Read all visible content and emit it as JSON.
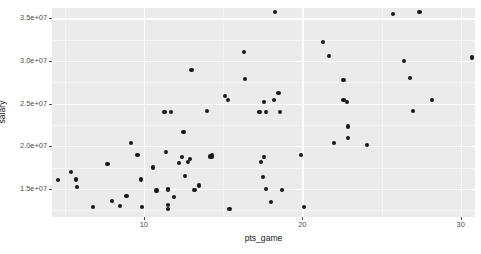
{
  "chart_data": {
    "type": "scatter",
    "title": "",
    "xlabel": "pts_game",
    "ylabel": "salary",
    "xlim": [
      4.2,
      30.9
    ],
    "ylim": [
      11700000,
      36200000
    ],
    "grid": true,
    "legend": null,
    "x_ticks": [
      {
        "value": 10,
        "label": "10"
      },
      {
        "value": 20,
        "label": "20"
      },
      {
        "value": 30,
        "label": "30"
      }
    ],
    "x_minor_ticks": [
      5,
      15,
      25
    ],
    "y_ticks": [
      {
        "value": 15000000,
        "label": "1.5e+07"
      },
      {
        "value": 20000000,
        "label": "2.0e+07"
      },
      {
        "value": 25000000,
        "label": "2.5e+07"
      },
      {
        "value": 30000000,
        "label": "3.0e+07"
      },
      {
        "value": 35000000,
        "label": "3.5e+07"
      }
    ],
    "y_minor_ticks": [
      12500000,
      17500000,
      22500000,
      27500000,
      32500000
    ],
    "point_color": "#1a1a1a",
    "panel_color": "#ebebeb",
    "gridline_color": "#ffffff",
    "points": [
      {
        "x": 4.6,
        "y": 16000000
      },
      {
        "x": 5.4,
        "y": 17000000
      },
      {
        "x": 5.7,
        "y": 16100000
      },
      {
        "x": 5.8,
        "y": 15200000
      },
      {
        "x": 6.8,
        "y": 12900000
      },
      {
        "x": 7.7,
        "y": 17900000
      },
      {
        "x": 8.0,
        "y": 13600000
      },
      {
        "x": 8.5,
        "y": 13000000
      },
      {
        "x": 8.9,
        "y": 14200000
      },
      {
        "x": 9.2,
        "y": 20400000
      },
      {
        "x": 9.6,
        "y": 19000000
      },
      {
        "x": 9.8,
        "y": 16100000
      },
      {
        "x": 9.9,
        "y": 12900000
      },
      {
        "x": 10.6,
        "y": 17500000
      },
      {
        "x": 10.8,
        "y": 14800000
      },
      {
        "x": 11.3,
        "y": 24000000
      },
      {
        "x": 11.4,
        "y": 19300000
      },
      {
        "x": 11.5,
        "y": 15000000
      },
      {
        "x": 11.5,
        "y": 14900000
      },
      {
        "x": 11.5,
        "y": 13100000
      },
      {
        "x": 11.5,
        "y": 12600000
      },
      {
        "x": 11.7,
        "y": 24000000
      },
      {
        "x": 11.9,
        "y": 14000000
      },
      {
        "x": 12.2,
        "y": 18000000
      },
      {
        "x": 12.4,
        "y": 18700000
      },
      {
        "x": 12.5,
        "y": 21700000
      },
      {
        "x": 12.6,
        "y": 16500000
      },
      {
        "x": 12.8,
        "y": 18100000
      },
      {
        "x": 12.9,
        "y": 18500000
      },
      {
        "x": 13.0,
        "y": 28900000
      },
      {
        "x": 13.2,
        "y": 14900000
      },
      {
        "x": 13.5,
        "y": 15400000
      },
      {
        "x": 14.0,
        "y": 24100000
      },
      {
        "x": 14.2,
        "y": 18800000
      },
      {
        "x": 14.3,
        "y": 18900000
      },
      {
        "x": 14.3,
        "y": 18700000
      },
      {
        "x": 15.1,
        "y": 25900000
      },
      {
        "x": 15.3,
        "y": 25400000
      },
      {
        "x": 15.4,
        "y": 12600000
      },
      {
        "x": 16.3,
        "y": 31000000
      },
      {
        "x": 16.4,
        "y": 27900000
      },
      {
        "x": 17.3,
        "y": 24000000
      },
      {
        "x": 17.4,
        "y": 18100000
      },
      {
        "x": 17.5,
        "y": 16400000
      },
      {
        "x": 17.6,
        "y": 25200000
      },
      {
        "x": 17.6,
        "y": 18700000
      },
      {
        "x": 17.7,
        "y": 24000000
      },
      {
        "x": 17.7,
        "y": 15000000
      },
      {
        "x": 18.0,
        "y": 13500000
      },
      {
        "x": 18.2,
        "y": 25400000
      },
      {
        "x": 18.3,
        "y": 35700000
      },
      {
        "x": 18.5,
        "y": 26200000
      },
      {
        "x": 18.6,
        "y": 24000000
      },
      {
        "x": 18.7,
        "y": 14900000
      },
      {
        "x": 19.9,
        "y": 19000000
      },
      {
        "x": 20.1,
        "y": 12900000
      },
      {
        "x": 21.3,
        "y": 32200000
      },
      {
        "x": 21.7,
        "y": 30600000
      },
      {
        "x": 22.0,
        "y": 20400000
      },
      {
        "x": 22.6,
        "y": 27800000
      },
      {
        "x": 22.6,
        "y": 25400000
      },
      {
        "x": 22.8,
        "y": 25200000
      },
      {
        "x": 22.9,
        "y": 22300000
      },
      {
        "x": 22.9,
        "y": 21000000
      },
      {
        "x": 24.1,
        "y": 20100000
      },
      {
        "x": 25.7,
        "y": 35500000
      },
      {
        "x": 26.4,
        "y": 30000000
      },
      {
        "x": 26.8,
        "y": 28000000
      },
      {
        "x": 27.0,
        "y": 24100000
      },
      {
        "x": 27.4,
        "y": 35700000
      },
      {
        "x": 28.2,
        "y": 25400000
      },
      {
        "x": 30.7,
        "y": 30400000
      }
    ]
  }
}
